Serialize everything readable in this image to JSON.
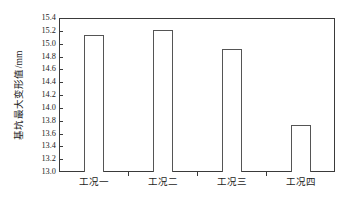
{
  "chart_data": {
    "type": "bar",
    "title": "",
    "xlabel": "",
    "ylabel": "基坑最大变形值/mm",
    "categories": [
      "工况一",
      "工况二",
      "工况三",
      "工况四"
    ],
    "values": [
      15.14,
      15.22,
      14.92,
      13.74
    ],
    "ylim": [
      13.0,
      15.4
    ],
    "ytick_step": 0.2,
    "ytick_labels": [
      "15.4",
      "15.2",
      "15.0",
      "14.8",
      "14.6",
      "14.4",
      "14.2",
      "14.0",
      "13.8",
      "13.6",
      "13.4",
      "13.2",
      "13.0"
    ],
    "grid": false,
    "legend": false,
    "legend_position": "none",
    "bar_fill_color": "#ffffff",
    "bar_edge_color": "#555555",
    "axis_color": "#3a3a3a",
    "background_color": "#ffffff"
  }
}
